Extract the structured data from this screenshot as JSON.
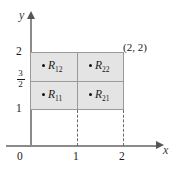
{
  "figure": {
    "axes": {
      "x_label": "x",
      "y_label": "y",
      "origin_label": "0"
    },
    "ticks": {
      "x": [
        "1",
        "2"
      ],
      "y_top": "2",
      "y_bottom": "1",
      "y_fraction_numerator": "3",
      "y_fraction_denominator": "2"
    },
    "cells": [
      {
        "name": "R12",
        "label": "R",
        "sub": "12"
      },
      {
        "name": "R22",
        "label": "R",
        "sub": "22"
      },
      {
        "name": "R11",
        "label": "R",
        "sub": "11"
      },
      {
        "name": "R21",
        "label": "R",
        "sub": "21"
      }
    ],
    "corner_point_label": "(2, 2)",
    "colors": {
      "region_fill": "#e4e4e4",
      "region_border": "#9a9a9a",
      "axis": "#8a8a8a",
      "dashed": "#6b6b6b",
      "text": "#1a1a1a"
    }
  },
  "chart_data": {
    "type": "diagram",
    "title": "",
    "xlabel": "x",
    "ylabel": "y",
    "xlim": [
      0,
      2.4
    ],
    "ylim": [
      0,
      2.4
    ],
    "xticks": [
      0,
      1,
      2
    ],
    "xticklabels": [
      "0",
      "1",
      "2"
    ],
    "yticks": [
      1,
      1.5,
      2
    ],
    "yticklabels": [
      "1",
      "3/2",
      "2"
    ],
    "grid": false,
    "legend": null,
    "region": {
      "x_range": [
        0,
        2
      ],
      "y_range": [
        1,
        2
      ]
    },
    "subrectangles": [
      {
        "label": "R11",
        "x_range": [
          0,
          1
        ],
        "y_range": [
          1,
          1.5
        ],
        "sample_point": [
          0.35,
          1.2
        ]
      },
      {
        "label": "R21",
        "x_range": [
          1,
          2
        ],
        "y_range": [
          1,
          1.5
        ],
        "sample_point": [
          1.35,
          1.2
        ]
      },
      {
        "label": "R12",
        "x_range": [
          0,
          1
        ],
        "y_range": [
          1.5,
          2
        ],
        "sample_point": [
          0.35,
          1.7
        ]
      },
      {
        "label": "R22",
        "x_range": [
          1,
          2
        ],
        "y_range": [
          1.5,
          2
        ],
        "sample_point": [
          1.35,
          1.7
        ]
      }
    ],
    "annotations": [
      {
        "text": "(2, 2)",
        "x": 2,
        "y": 2
      }
    ],
    "dashed_lines": [
      {
        "x": 1,
        "from_y": 0,
        "to_y": 1
      },
      {
        "x": 2,
        "from_y": 0,
        "to_y": 1
      }
    ]
  }
}
